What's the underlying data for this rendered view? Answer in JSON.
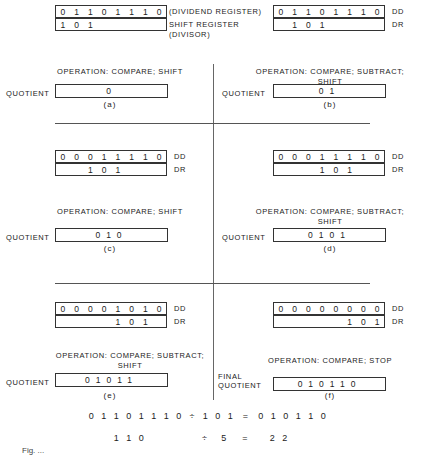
{
  "top_labels": {
    "dividend": "(DIVIDEND REGISTER)",
    "shift_register_line1": "SHIFT REGISTER",
    "shift_register_line2": "(DIVISOR)"
  },
  "labels": {
    "dd": "DD",
    "dr": "DR",
    "quotient": "QUOTIENT",
    "final_line1": "FINAL",
    "final_line2": "QUOTIENT"
  },
  "panels": [
    {
      "id": "a",
      "caption": "(a)",
      "dd_bits": [
        "0",
        "1",
        "1",
        "0",
        "1",
        "1",
        "1",
        "0"
      ],
      "dr_bits": [
        "1",
        "0",
        "1",
        "",
        "",
        "",
        "",
        ""
      ],
      "op_line1": "OPERATION: COMPARE; SHIFT",
      "op_line2": "",
      "quotient": "0"
    },
    {
      "id": "b",
      "caption": "(b)",
      "dd_bits": [
        "0",
        "1",
        "1",
        "0",
        "1",
        "1",
        "1",
        "0"
      ],
      "dr_bits": [
        "",
        "1",
        "0",
        "1",
        "",
        "",
        "",
        ""
      ],
      "op_line1": "OPERATION: COMPARE; SUBTRACT;",
      "op_line2": "SHIFT",
      "quotient": "01"
    },
    {
      "id": "c",
      "caption": "(c)",
      "dd_bits": [
        "0",
        "0",
        "0",
        "1",
        "1",
        "1",
        "1",
        "0"
      ],
      "dr_bits": [
        "",
        "",
        "1",
        "0",
        "1",
        "",
        "",
        ""
      ],
      "op_line1": "OPERATION: COMPARE; SHIFT",
      "op_line2": "",
      "quotient": "010"
    },
    {
      "id": "d",
      "caption": "(d)",
      "dd_bits": [
        "0",
        "0",
        "0",
        "1",
        "1",
        "1",
        "1",
        "0"
      ],
      "dr_bits": [
        "",
        "",
        "",
        "1",
        "0",
        "1",
        "",
        ""
      ],
      "op_line1": "OPERATION: COMPARE; SUBTRACT;",
      "op_line2": "SHIFT",
      "quotient": "0101"
    },
    {
      "id": "e",
      "caption": "(e)",
      "dd_bits": [
        "0",
        "0",
        "0",
        "0",
        "1",
        "0",
        "1",
        "0"
      ],
      "dr_bits": [
        "",
        "",
        "",
        "",
        "1",
        "0",
        "1",
        ""
      ],
      "op_line1": "OPERATION: COMPARE; SUBTRACT;",
      "op_line2": "SHIFT",
      "quotient": "01011"
    },
    {
      "id": "f",
      "caption": "(f)",
      "dd_bits": [
        "0",
        "0",
        "0",
        "0",
        "0",
        "0",
        "0",
        "0"
      ],
      "dr_bits": [
        "",
        "",
        "",
        "",
        "",
        "1",
        "0",
        "1"
      ],
      "op_line1": "OPERATION: COMPARE; STOP",
      "op_line2": "",
      "quotient": "010110"
    }
  ],
  "equation": {
    "binary": {
      "dividend": "01101110",
      "op": "÷",
      "divisor": "101",
      "eq": "=",
      "result": "010110"
    },
    "decimal": {
      "dividend": "110",
      "op": "÷",
      "divisor": "5",
      "eq": "=",
      "result": "22"
    }
  },
  "caption": "Fig. ..."
}
